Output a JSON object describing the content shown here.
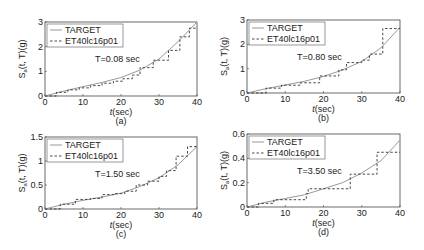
{
  "chart_data": [
    {
      "type": "line",
      "panel_label": "(a)",
      "annotation": "T=0.08 sec",
      "xlabel": "t(sec)",
      "ylabel": "S_a(t, T)(g)",
      "xlim": [
        0,
        40
      ],
      "ylim": [
        0,
        3
      ],
      "xticks": [
        0,
        10,
        20,
        30,
        40
      ],
      "yticks": [
        0,
        1,
        2,
        3
      ],
      "ytick_labels": [
        "0",
        "1",
        "2",
        "3"
      ],
      "legend": {
        "position": "top-left",
        "entries": [
          "TARGET",
          "ET40lc16p01"
        ]
      },
      "series": [
        {
          "name": "TARGET",
          "style": "solid",
          "x": [
            0,
            5,
            10,
            15,
            20,
            25,
            30,
            35,
            40
          ],
          "y": [
            0,
            0.2,
            0.38,
            0.55,
            0.75,
            1.05,
            1.5,
            2.2,
            3.0
          ]
        },
        {
          "name": "ET40lc16p01",
          "style": "dashed-step",
          "x": [
            0,
            3,
            6,
            9,
            12,
            15,
            18,
            20.5,
            23,
            25,
            27.5,
            28.5,
            31,
            32.5,
            35.5,
            38,
            40
          ],
          "y": [
            0,
            0.15,
            0.25,
            0.33,
            0.42,
            0.52,
            0.6,
            0.7,
            0.85,
            1.15,
            1.15,
            1.45,
            1.45,
            1.85,
            2.4,
            2.75,
            2.75
          ]
        }
      ]
    },
    {
      "type": "line",
      "panel_label": "(b)",
      "annotation": "T=0.80 sec",
      "xlabel": "t(sec)",
      "ylabel": "S_a(t, T)(g)",
      "xlim": [
        0,
        40
      ],
      "ylim": [
        0,
        3
      ],
      "xticks": [
        0,
        10,
        20,
        30,
        40
      ],
      "yticks": [
        0,
        1,
        2,
        3
      ],
      "ytick_labels": [
        "0",
        "1",
        "2",
        "3"
      ],
      "legend": {
        "position": "top-left",
        "entries": [
          "TARGET",
          "ET40lc16p01"
        ]
      },
      "series": [
        {
          "name": "TARGET",
          "style": "solid",
          "x": [
            0,
            5,
            10,
            15,
            20,
            25,
            30,
            35,
            40
          ],
          "y": [
            0,
            0.18,
            0.33,
            0.48,
            0.68,
            0.95,
            1.3,
            1.85,
            2.7
          ]
        },
        {
          "name": "ET40lc16p01",
          "style": "dashed-step",
          "x": [
            0,
            5,
            9,
            14,
            19,
            24,
            26,
            30,
            32,
            35.5,
            40
          ],
          "y": [
            0,
            0.2,
            0.32,
            0.42,
            0.7,
            0.95,
            1.25,
            1.35,
            1.6,
            2.65,
            2.65
          ]
        }
      ]
    },
    {
      "type": "line",
      "panel_label": "(c)",
      "annotation": "T=1.50 sec",
      "xlabel": "t(sec)",
      "ylabel": "S_a(t, T)(g)",
      "xlim": [
        0,
        40
      ],
      "ylim": [
        0,
        1.5
      ],
      "xticks": [
        0,
        10,
        20,
        30,
        40
      ],
      "yticks": [
        0,
        0.5,
        1,
        1.5
      ],
      "ytick_labels": [
        "0",
        "0.5",
        "1",
        "1.5"
      ],
      "legend": {
        "position": "top-left",
        "entries": [
          "TARGET",
          "ET40lc16p01"
        ]
      },
      "series": [
        {
          "name": "TARGET",
          "style": "solid",
          "x": [
            0,
            5,
            10,
            15,
            20,
            25,
            30,
            35,
            40
          ],
          "y": [
            0,
            0.1,
            0.18,
            0.25,
            0.33,
            0.47,
            0.65,
            0.92,
            1.3
          ]
        },
        {
          "name": "ET40lc16p01",
          "style": "dashed-step",
          "x": [
            0,
            4,
            8,
            12,
            15,
            18,
            21,
            24,
            27,
            30,
            32,
            34.5,
            37.5,
            40
          ],
          "y": [
            0,
            0.1,
            0.2,
            0.22,
            0.3,
            0.32,
            0.37,
            0.5,
            0.58,
            0.68,
            0.8,
            1.1,
            1.3,
            1.3
          ]
        }
      ]
    },
    {
      "type": "line",
      "panel_label": "(d)",
      "annotation": "T=3.50 sec",
      "xlabel": "t(sec)",
      "ylabel": "S_a(t, T)(g)",
      "xlim": [
        0,
        40
      ],
      "ylim": [
        0,
        0.6
      ],
      "xticks": [
        0,
        10,
        20,
        30,
        40
      ],
      "yticks": [
        0,
        0.2,
        0.4,
        0.6
      ],
      "ytick_labels": [
        "0",
        "0.2",
        "0.4",
        "0.6"
      ],
      "legend": {
        "position": "top-left",
        "entries": [
          "TARGET",
          "ET40lc16p01"
        ]
      },
      "series": [
        {
          "name": "TARGET",
          "style": "solid",
          "x": [
            0,
            5,
            10,
            15,
            20,
            25,
            30,
            35,
            40
          ],
          "y": [
            0,
            0.04,
            0.07,
            0.1,
            0.15,
            0.2,
            0.28,
            0.38,
            0.55
          ]
        },
        {
          "name": "ET40lc16p01",
          "style": "dashed-step",
          "x": [
            0,
            3,
            7,
            15.5,
            16,
            27,
            34,
            40
          ],
          "y": [
            0,
            0.03,
            0.06,
            0.11,
            0.15,
            0.27,
            0.45,
            0.45
          ]
        }
      ]
    }
  ]
}
